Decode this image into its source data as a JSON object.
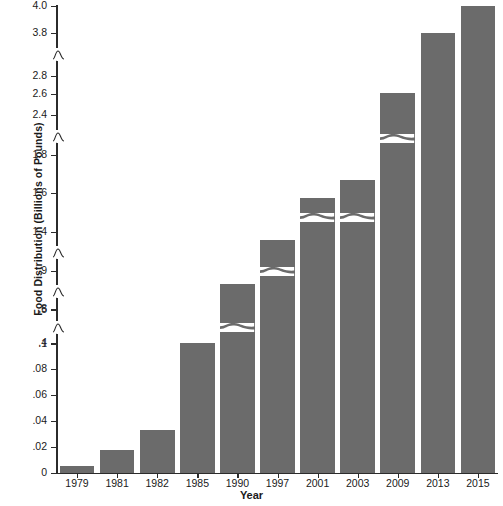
{
  "chart_data": {
    "type": "bar",
    "title": "",
    "xlabel": "Year",
    "ylabel": "Food Distribution (Billions of Pounds)",
    "categories": [
      "1979",
      "1981",
      "1982",
      "1985",
      "1990",
      "1997",
      "2001",
      "2003",
      "2009",
      "2013",
      "2015"
    ],
    "values": [
      0.005,
      0.018,
      0.032,
      0.1,
      0.48,
      0.6,
      1.4,
      1.8,
      2.6,
      3.8,
      4.0
    ],
    "bar_color": "#6b6b6b",
    "grid": false,
    "legend": "none",
    "y_axis_type": "broken",
    "y_tick_labels": [
      "0",
      ".02",
      ".04",
      ".06",
      ".08",
      ".1",
      ".4",
      ".5",
      ".8",
      ".9",
      "1.4",
      "1.6",
      "1.8",
      "2.4",
      "2.6",
      "2.8",
      "3.8",
      "4.0"
    ],
    "y_tick_values": [
      0,
      0.02,
      0.04,
      0.06,
      0.08,
      0.1,
      0.4,
      0.5,
      0.8,
      0.9,
      1.4,
      1.6,
      1.8,
      2.4,
      2.6,
      2.8,
      3.8,
      4.0
    ],
    "y_axis_breaks": [
      {
        "between": [
          ".1",
          ".4"
        ]
      },
      {
        "between": [
          ".5",
          ".8"
        ]
      },
      {
        "between": [
          ".9",
          "1.4"
        ]
      },
      {
        "between": [
          "1.8",
          "2.4"
        ]
      },
      {
        "between": [
          "2.8",
          "3.8"
        ]
      }
    ],
    "ylim": [
      0,
      4.0
    ]
  },
  "ticks": [
    {
      "label": "4.0",
      "y": 6
    },
    {
      "label": "3.8",
      "y": 33
    },
    {
      "label": "2.8",
      "y": 76
    },
    {
      "label": "2.6",
      "y": 94
    },
    {
      "label": "2.4",
      "y": 115
    },
    {
      "label": "1.8",
      "y": 155
    },
    {
      "label": "1.6",
      "y": 193
    },
    {
      "label": "1.4",
      "y": 232
    },
    {
      "label": ".9",
      "y": 271
    },
    {
      "label": ".8",
      "y": 309
    },
    {
      "label": ".5",
      "y": 310
    },
    {
      "label": ".4",
      "y": 343
    },
    {
      "label": ".1",
      "y": 344
    },
    {
      "label": ".08",
      "y": 369
    },
    {
      "label": ".06",
      "y": 395
    },
    {
      "label": ".04",
      "y": 421
    },
    {
      "label": ".02",
      "y": 447
    },
    {
      "label": "0",
      "y": 473
    }
  ],
  "bars": [
    {
      "year": "1979",
      "value": "0.005",
      "top": 466,
      "breaks": []
    },
    {
      "year": "1981",
      "value": "0.018",
      "top": 450,
      "breaks": []
    },
    {
      "year": "1982",
      "value": "0.032",
      "top": 430,
      "breaks": []
    },
    {
      "year": "1985",
      "value": "0.1",
      "top": 343,
      "breaks": []
    },
    {
      "year": "1990",
      "value": "0.48",
      "top": 284,
      "breaks": [
        322
      ]
    },
    {
      "year": "1997",
      "value": "0.6",
      "top": 240,
      "breaks": [
        266
      ]
    },
    {
      "year": "2001",
      "value": "1.4",
      "top": 198,
      "breaks": [
        212
      ]
    },
    {
      "year": "2003",
      "value": "1.8",
      "top": 180,
      "breaks": [
        212
      ]
    },
    {
      "year": "2009",
      "value": "2.6",
      "top": 93,
      "breaks": [
        133
      ]
    },
    {
      "year": "2013",
      "value": "3.8",
      "top": 33,
      "breaks": []
    },
    {
      "year": "2015",
      "value": "4.0",
      "top": 6,
      "breaks": []
    }
  ]
}
